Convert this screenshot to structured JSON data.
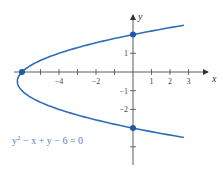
{
  "chart_data": {
    "type": "line",
    "title": "",
    "equation": "y² − x + y − 6 = 0",
    "equation_parts": {
      "base": "y",
      "exp": "2",
      "rest": " − x + y − 6 = 0"
    },
    "xlabel": "x",
    "ylabel": "y",
    "xlim": [
      -6.5,
      4
    ],
    "ylim": [
      -5,
      3
    ],
    "x_ticks": [
      -6,
      -5,
      -4,
      -3,
      -2,
      -1,
      1,
      2,
      3
    ],
    "x_tick_labels": [
      {
        "value": -4,
        "label": "−4"
      },
      {
        "value": -2,
        "label": "−2"
      },
      {
        "value": 1,
        "label": "1"
      },
      {
        "value": 2,
        "label": "2"
      },
      {
        "value": 3,
        "label": "3"
      }
    ],
    "y_ticks": [
      1,
      -1,
      -2,
      -4
    ],
    "y_tick_labels": [
      {
        "value": 1,
        "label": "1"
      },
      {
        "value": -1,
        "label": "−1"
      },
      {
        "value": -2,
        "label": "−2"
      }
    ],
    "grid": false,
    "series": [
      {
        "name": "y^2 - x + y - 6 = 0",
        "relation": "x = y^2 + y - 6",
        "color": "#2f6db5",
        "y_range": [
          -3.5,
          2.5
        ],
        "points": [
          {
            "x": 2.75,
            "y": 2.5
          },
          {
            "x": 0,
            "y": 2
          },
          {
            "x": -4,
            "y": 1
          },
          {
            "x": -6,
            "y": 0
          },
          {
            "x": -6.25,
            "y": -0.5
          },
          {
            "x": -6,
            "y": -1
          },
          {
            "x": -4,
            "y": -2
          },
          {
            "x": 0,
            "y": -3
          },
          {
            "x": 2.75,
            "y": -3.5
          }
        ]
      }
    ],
    "marked_points": [
      {
        "x": 0,
        "y": 2,
        "label": "y-intercept"
      },
      {
        "x": 0,
        "y": -3,
        "label": "y-intercept"
      },
      {
        "x": -6,
        "y": 0,
        "label": "x-intercept"
      }
    ]
  },
  "colors": {
    "curve": "#2f6db5",
    "axis": "#333333",
    "equation_text": "#4f7fc0"
  }
}
